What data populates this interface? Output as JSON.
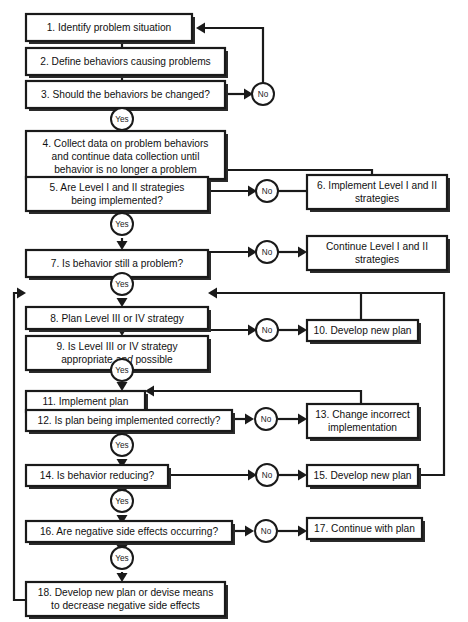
{
  "diagram": {
    "type": "flowchart",
    "colors": {
      "line": "#1a1a1a",
      "box_fill": "#ffffff",
      "text": "#111111",
      "background": "#ffffff"
    },
    "decision_labels": {
      "yes": "Yes",
      "no": "No"
    },
    "nodes": [
      {
        "id": "n1",
        "number": "1.",
        "lines": [
          "Identify problem situation"
        ]
      },
      {
        "id": "n2",
        "number": "2.",
        "lines": [
          "Define behaviors causing problems"
        ]
      },
      {
        "id": "n3",
        "number": "3.",
        "lines": [
          "Should the behaviors be changed?"
        ]
      },
      {
        "id": "n4",
        "number": "4.",
        "lines": [
          "Collect data on problem behaviors",
          "and continue data collection until",
          "behavior is no longer a problem"
        ]
      },
      {
        "id": "n5",
        "number": "5.",
        "lines": [
          "Are Level I and II strategies",
          "being implemented?"
        ]
      },
      {
        "id": "n6",
        "number": "6.",
        "lines": [
          "Implement Level I and II",
          "strategies"
        ]
      },
      {
        "id": "n7",
        "number": "7.",
        "lines": [
          "Is behavior still a problem?"
        ]
      },
      {
        "id": "n7b",
        "number": "",
        "lines": [
          "Continue Level I and II",
          "strategies"
        ]
      },
      {
        "id": "n8",
        "number": "8.",
        "lines": [
          "Plan Level III or IV strategy"
        ]
      },
      {
        "id": "n9",
        "number": "9.",
        "lines": [
          "Is Level III or IV strategy",
          "appropriate and possible"
        ]
      },
      {
        "id": "n10",
        "number": "10.",
        "lines": [
          "Develop new plan"
        ]
      },
      {
        "id": "n11",
        "number": "11.",
        "lines": [
          "Implement plan"
        ]
      },
      {
        "id": "n12",
        "number": "12.",
        "lines": [
          "Is plan being implemented correctly?"
        ]
      },
      {
        "id": "n13",
        "number": "13.",
        "lines": [
          "Change incorrect",
          "implementation"
        ]
      },
      {
        "id": "n14",
        "number": "14.",
        "lines": [
          "Is behavior reducing?"
        ]
      },
      {
        "id": "n15",
        "number": "15.",
        "lines": [
          "Develop new plan"
        ]
      },
      {
        "id": "n16",
        "number": "16.",
        "lines": [
          "Are negative side effects occurring?"
        ]
      },
      {
        "id": "n17",
        "number": "17.",
        "lines": [
          "Continue with plan"
        ]
      },
      {
        "id": "n18",
        "number": "18.",
        "lines": [
          "Develop new plan or devise means",
          "to decrease negative side effects"
        ]
      }
    ],
    "text": {
      "n1_l1": "1.  Identify problem situation",
      "n2_l1": "2.  Define behaviors causing problems",
      "n3_l1": "3.  Should the behaviors be changed?",
      "n4_l1": "4.  Collect data on problem behaviors",
      "n4_l2": "and continue data collection until",
      "n4_l3": "behavior is no longer a problem",
      "n5_l1": "5.  Are Level I and II strategies",
      "n5_l2": "being implemented?",
      "n6_l1": "6.  Implement Level I and II",
      "n6_l2": "strategies",
      "n7_l1": "7.  Is behavior still a problem?",
      "n7b_l1": "Continue Level I and II",
      "n7b_l2": "strategies",
      "n8_l1": "8.  Plan Level III or IV strategy",
      "n9_l1": "9.  Is Level III or IV strategy",
      "n9_l2a": "appropriate ",
      "n9_l2b": "and",
      "n9_l2c": " possible",
      "n10_l1": "10.  Develop new plan",
      "n11_l1": "11.  Implement plan",
      "n12_l1": "12.  Is plan being implemented correctly?",
      "n13_l1": "13.  Change incorrect",
      "n13_l2": "implementation",
      "n14_l1": "14.  Is behavior reducing?",
      "n15_l1": "15.  Develop new plan",
      "n16_l1": "16.  Are negative side effects occurring?",
      "n17_l1": "17.  Continue with plan",
      "n18_l1": "18.  Develop new plan or devise means",
      "n18_l2": "to decrease negative side effects",
      "yes1": "Yes",
      "yes2": "Yes",
      "yes3": "Yes",
      "yes4": "Yes",
      "yes5": "Yes",
      "yes6": "Yes",
      "yes7": "Yes",
      "no1": "No",
      "no2": "No",
      "no3": "No",
      "no4": "No",
      "no5": "No",
      "no6": "No"
    }
  }
}
